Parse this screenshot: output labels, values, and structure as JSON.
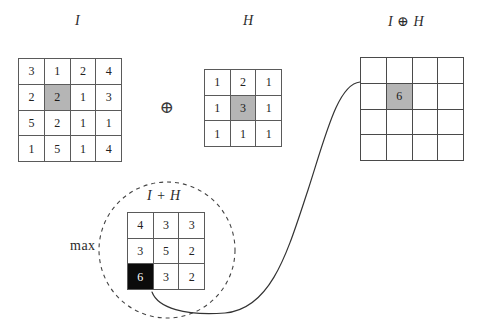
{
  "figure": {
    "title_labels": {
      "input_matrix": "I",
      "kernel_matrix": "H",
      "output_matrix": "I ⊕ H",
      "sum_matrix": "I + H",
      "max_operation": "max",
      "operator_symbol": "⊕"
    }
  },
  "matrices": {
    "input": {
      "name": "I",
      "rows": 4,
      "cols": 4,
      "values": [
        [
          3,
          1,
          2,
          4
        ],
        [
          2,
          2,
          1,
          3
        ],
        [
          5,
          2,
          1,
          1
        ],
        [
          1,
          5,
          1,
          4
        ]
      ],
      "highlight": {
        "row": 1,
        "col": 1,
        "style": "gray"
      }
    },
    "kernel": {
      "name": "H",
      "rows": 3,
      "cols": 3,
      "values": [
        [
          1,
          2,
          1
        ],
        [
          1,
          3,
          1
        ],
        [
          1,
          1,
          1
        ]
      ],
      "highlight": {
        "row": 1,
        "col": 1,
        "style": "gray"
      }
    },
    "sum": {
      "name": "I + H",
      "rows": 3,
      "cols": 3,
      "values": [
        [
          4,
          3,
          3
        ],
        [
          3,
          5,
          2
        ],
        [
          6,
          3,
          2
        ]
      ],
      "highlight": {
        "row": 2,
        "col": 0,
        "style": "black"
      }
    },
    "output": {
      "name": "I ⊕ H",
      "rows": 4,
      "cols": 4,
      "values": [
        [
          "",
          "",
          "",
          ""
        ],
        [
          "",
          "6",
          "",
          ""
        ],
        [
          "",
          "",
          "",
          ""
        ],
        [
          "",
          "",
          "",
          ""
        ]
      ],
      "highlight": {
        "row": 1,
        "col": 1,
        "style": "gray"
      }
    }
  },
  "colors": {
    "grid_line": "#5a5a5a",
    "grid_line_output": "#4a4a4a",
    "cell_background": "#ffffff",
    "highlight_gray": "#b5b5b5",
    "highlight_black": "#0b0b0b",
    "text": "#222222",
    "label_text": "#2b2b2b",
    "curve_stroke": "#333333",
    "dashed_circle_stroke": "#444444"
  },
  "annotations": {
    "dashed_circle": {
      "cx": 167,
      "cy": 250,
      "r": 68,
      "dash": "4 4"
    },
    "connector_curve": {
      "description": "S-curve from max cell of I+H to highlighted output cell",
      "path": "M 152 292 C 160 312, 200 316, 240 312 C 290 306, 300 240, 320 180 C 340 120, 345 82, 360 82"
    }
  }
}
